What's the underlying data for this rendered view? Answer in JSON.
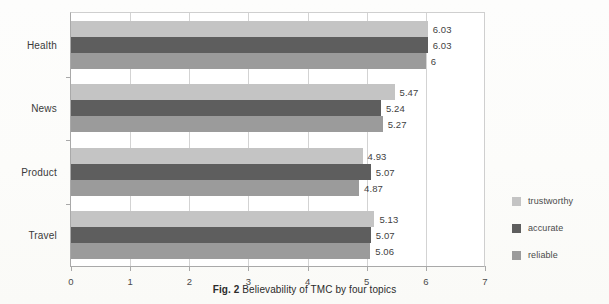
{
  "caption": {
    "prefix": "Fig. 2",
    "text": "Believability of TMC by four topics"
  },
  "legend": {
    "position": "right",
    "items": [
      {
        "label": "trustworthy",
        "color": "#c4c4c4"
      },
      {
        "label": "accurate",
        "color": "#5e5e5e"
      },
      {
        "label": "reliable",
        "color": "#9b9b9b"
      }
    ]
  },
  "chart_data": {
    "type": "bar",
    "orientation": "horizontal",
    "title": "Believability of TMC by four topics",
    "xlabel": "",
    "ylabel": "",
    "xlim": [
      0,
      7
    ],
    "ylim": null,
    "grid": true,
    "xticks": [
      "0",
      "1",
      "2",
      "3",
      "4",
      "5",
      "6",
      "7"
    ],
    "categories": [
      "Health",
      "News",
      "Product",
      "Travel"
    ],
    "series": [
      {
        "name": "trustworthy",
        "color": "#c4c4c4",
        "values": [
          6.03,
          5.47,
          4.93,
          5.13
        ],
        "labels": [
          "6.03",
          "5.47",
          "4.93",
          "5.13"
        ]
      },
      {
        "name": "accurate",
        "color": "#5e5e5e",
        "values": [
          6.03,
          5.24,
          5.07,
          5.07
        ],
        "labels": [
          "6.03",
          "5.24",
          "5.07",
          "5.07"
        ]
      },
      {
        "name": "reliable",
        "color": "#9b9b9b",
        "values": [
          6,
          5.27,
          4.87,
          5.06
        ],
        "labels": [
          "6",
          "5.27",
          "4.87",
          "5.06"
        ]
      }
    ]
  }
}
